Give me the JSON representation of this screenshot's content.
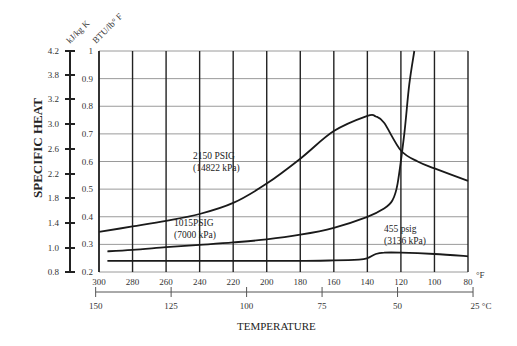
{
  "chart_data": {
    "type": "line",
    "title": "",
    "ylabel": "SPECIFIC HEAT",
    "xlabel": "TEMPERATURE",
    "y_units": {
      "left": "kJ/kg K",
      "right": "BTU/lb° F"
    },
    "x_units": {
      "primary": "°F",
      "secondary": "°C"
    },
    "y_ticks_btu": [
      "1",
      "0.9",
      "0.8",
      "0.7",
      "0.6",
      "0.5",
      "0.4",
      "0.3",
      "0.2"
    ],
    "y_ticks_kj": [
      "4.2",
      "3.8",
      "3.2",
      "3.0",
      "2.6",
      "2.2",
      "1.8",
      "1.4",
      "1.0",
      "0.8"
    ],
    "x_ticks_f": [
      "300",
      "280",
      "260",
      "240",
      "220",
      "200",
      "180",
      "160",
      "140",
      "120",
      "100",
      "80"
    ],
    "x_ticks_c": [
      "150",
      "125",
      "100",
      "75",
      "50",
      "25"
    ],
    "ylim": [
      0.2,
      1.0
    ],
    "xlim_f": [
      300,
      80
    ],
    "grid": true,
    "series": [
      {
        "name": "2150 PSIG (14822 kPa)",
        "x": [
          300,
          280,
          260,
          240,
          220,
          200,
          180,
          160,
          140,
          135,
          130,
          120,
          110,
          100,
          80
        ],
        "values": [
          0.345,
          0.365,
          0.385,
          0.41,
          0.45,
          0.52,
          0.61,
          0.71,
          0.765,
          0.763,
          0.74,
          0.64,
          0.6,
          0.575,
          0.53
        ]
      },
      {
        "name": "1015PSIG (7000 kPa)",
        "x": [
          295,
          280,
          260,
          240,
          220,
          200,
          180,
          160,
          140,
          130,
          125,
          122,
          118,
          115,
          112
        ],
        "values": [
          0.275,
          0.28,
          0.29,
          0.298,
          0.307,
          0.318,
          0.335,
          0.36,
          0.4,
          0.43,
          0.46,
          0.52,
          0.7,
          0.88,
          1.0
        ]
      },
      {
        "name": "455 psig (3136 kPa)",
        "x": [
          295,
          280,
          260,
          240,
          220,
          200,
          180,
          160,
          145,
          140,
          135,
          130,
          120,
          100,
          80
        ],
        "values": [
          0.24,
          0.24,
          0.24,
          0.24,
          0.24,
          0.24,
          0.24,
          0.242,
          0.245,
          0.25,
          0.265,
          0.27,
          0.27,
          0.265,
          0.257
        ]
      }
    ],
    "annotations": [
      {
        "text": "2150 PSIG",
        "sub": "(14822 kPa)"
      },
      {
        "text": "1015PSIG",
        "sub": "(7000 kPa)"
      },
      {
        "text": "455 psig",
        "sub": "(3136 kPa)"
      }
    ]
  },
  "labels": {
    "ylabel": "SPECIFIC HEAT",
    "xlabel": "TEMPERATURE",
    "unit_kj": "kJ/kg K",
    "unit_btu": "BTU/lb° F",
    "unit_f": "°F",
    "unit_c": "°C",
    "anno1_a": "2150 PSIG",
    "anno1_b": "(14822 kPa)",
    "anno2_a": "1015PSIG",
    "anno2_b": "(7000 kPa)",
    "anno3_a": "455 psig",
    "anno3_b": "(3136 kPa)"
  }
}
